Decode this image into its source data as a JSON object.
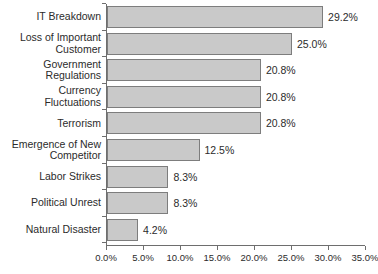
{
  "chart_data": {
    "type": "bar",
    "orientation": "horizontal",
    "title": "",
    "xlabel": "",
    "ylabel": "",
    "grid": false,
    "legend": false,
    "xlim": [
      0,
      35
    ],
    "xticks": [
      "0.0%",
      "5.0%",
      "10.0%",
      "15.0%",
      "20.0%",
      "25.0%",
      "30.0%",
      "35.0%"
    ],
    "xtick_values": [
      0,
      5,
      10,
      15,
      20,
      25,
      30,
      35
    ],
    "categories": [
      "IT Breakdown",
      "Loss of Important\nCustomer",
      "Government\nRegulations",
      "Currency\nFluctuations",
      "Terrorism",
      "Emergence of New\nCompetitor",
      "Labor Strikes",
      "Political Unrest",
      "Natural Disaster"
    ],
    "values": [
      29.2,
      25.0,
      20.8,
      20.8,
      20.8,
      12.5,
      8.3,
      8.3,
      4.2
    ],
    "value_labels": [
      "29.2%",
      "25.0%",
      "20.8%",
      "20.8%",
      "20.8%",
      "12.5%",
      "8.3%",
      "8.3%",
      "4.2%"
    ],
    "colors": {
      "bar_fill": "#c9c9c9",
      "bar_border": "#7d7d7d",
      "axis": "#6e6e6e",
      "text": "#2b2b2b",
      "background": "#ffffff"
    }
  }
}
